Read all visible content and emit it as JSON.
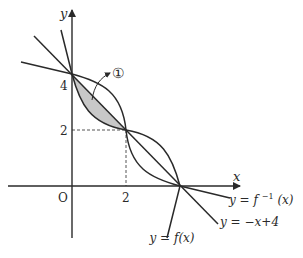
{
  "diagram": {
    "type": "function-graph",
    "axes": {
      "x_label": "x",
      "y_label": "y",
      "origin_label": "O"
    },
    "ticks": {
      "x_tick": "2",
      "y_tick_2": "2",
      "y_tick_4": "4"
    },
    "curves": [
      {
        "name": "f",
        "label": "y = f(x)",
        "label_parts": {
          "lhs": "y",
          "eq": "=",
          "rhs": "f(x)"
        }
      },
      {
        "name": "f_inverse",
        "label": "y = f⁻¹(x)",
        "label_parts": {
          "lhs": "y",
          "eq": "=",
          "rhs_base": "f",
          "rhs_sup": "−1",
          "rhs_arg": "(x)"
        }
      },
      {
        "name": "line",
        "label": "y = −x + 4",
        "label_parts": {
          "lhs": "y",
          "eq": "=",
          "rhs": "−x+4"
        }
      }
    ],
    "region": {
      "label": "①",
      "description": "shaded region between y=f(x) and y=-x+4 for 0 ≤ x ≤ 2"
    },
    "key_points": [
      {
        "x": 0,
        "y": 4
      },
      {
        "x": 2,
        "y": 2
      },
      {
        "x": 4,
        "y": 0
      }
    ],
    "colors": {
      "stroke": "#2a2a2a",
      "shade": "#c8c8c8",
      "dashed": "#555555"
    }
  }
}
